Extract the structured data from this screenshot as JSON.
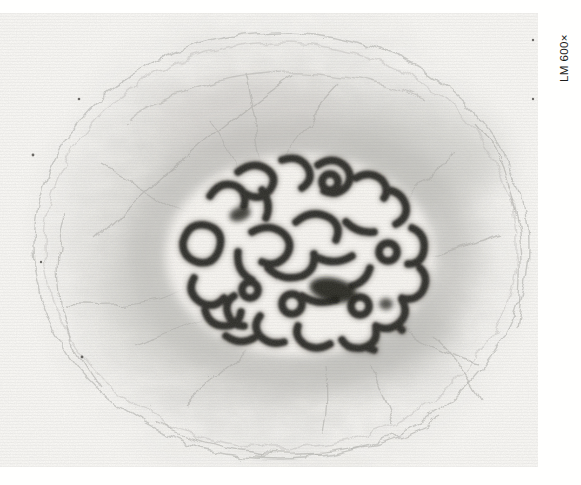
{
  "figure": {
    "magnification_label": "LM 600×"
  },
  "colors": {
    "page_background": "#ffffff",
    "photo_background": "#f7f6f3",
    "chromatin": "#2b2926",
    "nucleus": "#f4f2ee",
    "fibers": "#b0afab",
    "label_text": "#1d1d1b"
  }
}
